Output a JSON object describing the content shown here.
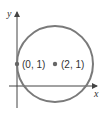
{
  "diagram": {
    "axes": {
      "x_label": "x",
      "y_label": "y"
    },
    "circle": {
      "center": [
        2,
        1
      ],
      "radius": 2,
      "stroke": "#7a7a7a"
    },
    "points": [
      {
        "label": "(0, 1)",
        "coords": [
          0,
          1
        ]
      },
      {
        "label": "(2, 1)",
        "coords": [
          2,
          1
        ]
      }
    ],
    "point_color": "#666666"
  }
}
